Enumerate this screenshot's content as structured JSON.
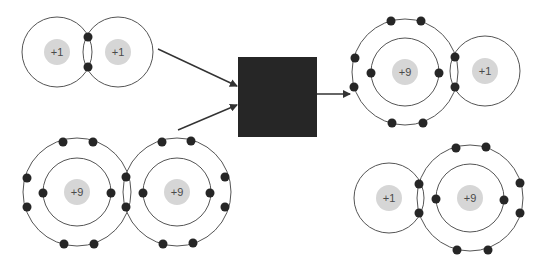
{
  "colors": {
    "shell": "#555555",
    "nucleus": "#d6d6d6",
    "nucleus_text": "#4a4a4a",
    "electron": "#262626",
    "arrow": "#333333",
    "redaction_box": "#262626"
  },
  "reactants": [
    {
      "name": "hydrogen-molecule",
      "atoms": [
        {
          "element": "H",
          "charge_label": "+1",
          "cx": 57,
          "cy": 52,
          "shells": [
            35
          ]
        },
        {
          "element": "H",
          "charge_label": "+1",
          "cx": 118,
          "cy": 52,
          "shells": [
            35
          ]
        }
      ],
      "shared_electrons": 2
    },
    {
      "name": "fluorine-molecule",
      "atoms": [
        {
          "element": "F",
          "charge_label": "+9",
          "cx": 77,
          "cy": 192,
          "shells": [
            34,
            54
          ]
        },
        {
          "element": "F",
          "charge_label": "+9",
          "cx": 177,
          "cy": 192,
          "shells": [
            34,
            54
          ]
        }
      ],
      "shared_electrons": 2
    }
  ],
  "process_box": {
    "label": "",
    "redacted": true
  },
  "products": [
    {
      "name": "hydrogen-fluoride-molecule-1",
      "atoms": [
        {
          "element": "F",
          "charge_label": "+9",
          "cx": 405,
          "cy": 72,
          "shells": [
            34,
            53
          ]
        },
        {
          "element": "H",
          "charge_label": "+1",
          "cx": 485,
          "cy": 71,
          "shells": [
            35
          ]
        }
      ],
      "shared_electrons": 2
    },
    {
      "name": "hydrogen-fluoride-molecule-2",
      "atoms": [
        {
          "element": "H",
          "charge_label": "+1",
          "cx": 389,
          "cy": 198,
          "shells": [
            35
          ]
        },
        {
          "element": "F",
          "charge_label": "+9",
          "cx": 470,
          "cy": 198,
          "shells": [
            34,
            53
          ]
        }
      ],
      "shared_electrons": 2
    }
  ]
}
